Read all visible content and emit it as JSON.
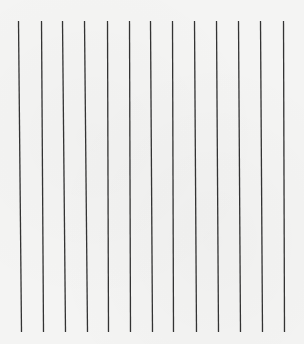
{
  "sheet": {
    "background_color": "#f4f4f3",
    "line_color": "#333333",
    "line_count": 13,
    "line_top_y": 21,
    "line_bottom_y": 332,
    "lines": [
      {
        "x_top": 18,
        "x_bottom": 21
      },
      {
        "x_top": 41,
        "x_bottom": 43
      },
      {
        "x_top": 62,
        "x_bottom": 65
      },
      {
        "x_top": 84,
        "x_bottom": 87
      },
      {
        "x_top": 107,
        "x_bottom": 108
      },
      {
        "x_top": 129,
        "x_bottom": 130
      },
      {
        "x_top": 150,
        "x_bottom": 152
      },
      {
        "x_top": 172,
        "x_bottom": 173
      },
      {
        "x_top": 194,
        "x_bottom": 196
      },
      {
        "x_top": 216,
        "x_bottom": 218
      },
      {
        "x_top": 238,
        "x_bottom": 240
      },
      {
        "x_top": 260,
        "x_bottom": 262
      },
      {
        "x_top": 283,
        "x_bottom": 284
      }
    ]
  }
}
